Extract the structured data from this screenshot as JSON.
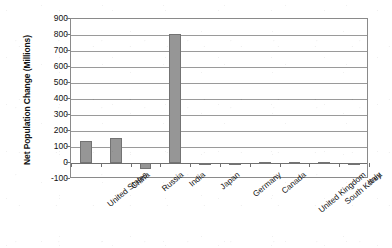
{
  "chart_data": {
    "type": "bar",
    "title": "",
    "xlabel": "",
    "ylabel": "Net Population Change (Millions)",
    "categories": [
      "United States",
      "China",
      "Russia",
      "India",
      "Japan",
      "Germany",
      "Canada",
      "United Kingdom",
      "South Korea",
      "Italy"
    ],
    "values": [
      140,
      157,
      -40,
      805,
      -8,
      -10,
      8,
      5,
      3,
      -2
    ],
    "ylim": [
      -100,
      900
    ],
    "ytick_step": 100,
    "yticks": [
      900,
      800,
      700,
      600,
      500,
      400,
      300,
      200,
      100,
      0,
      -100
    ],
    "ytick_labels": [
      "900",
      "800",
      "700",
      "600",
      "500",
      "400",
      "300",
      "200",
      "100",
      "0",
      "-100"
    ],
    "grid": "horizontal",
    "legend": "none",
    "series": [
      {
        "name": "Net Population Change",
        "values": [
          140,
          157,
          -40,
          805,
          -8,
          -10,
          8,
          5,
          3,
          -2
        ]
      }
    ]
  },
  "style": {
    "bar_fill": "#969696",
    "bar_stroke": "#737373",
    "gridline_color": "#9a9a9a",
    "frame_color": "#8a8a8a",
    "text_color": "#111111",
    "background": "#ffffff"
  }
}
